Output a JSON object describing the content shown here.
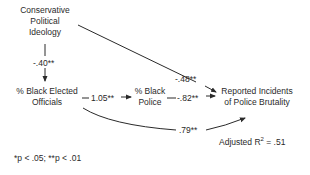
{
  "nodes": {
    "ideology": {
      "line1": "Conservative",
      "line2": "Political",
      "line3": "Ideology"
    },
    "officials": {
      "line1": "% Black Elected",
      "line2": "Officials"
    },
    "police": {
      "line1": "% Black",
      "line2": "Police"
    },
    "brutality": {
      "line1": "Reported Incidents",
      "line2": "of Police Brutality"
    }
  },
  "paths": {
    "ideology_to_officials": "-.40**",
    "officials_to_police": "1.05**",
    "police_to_brutality": "-.82**",
    "ideology_to_brutality": "-.48**",
    "officials_to_brutality": ".79**"
  },
  "fit": {
    "label": "Adjusted R",
    "sup": "2",
    "value": " = .51"
  },
  "footnote": "*p < .05; **p < .01"
}
